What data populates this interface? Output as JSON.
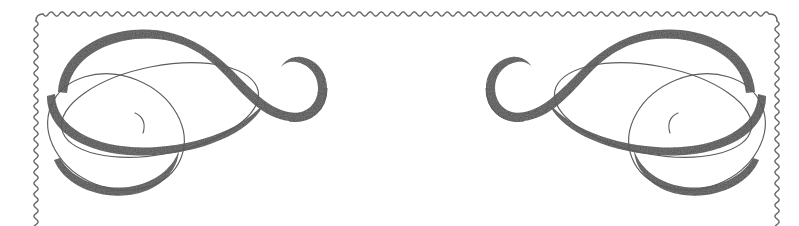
{
  "document": {
    "title": "Decorative Certificate Border Ornament",
    "description": "Scalloped rectangular border frame with mirrored calligraphic corner flourishes",
    "width": 799,
    "height": 226
  },
  "canvas": {
    "background_color": "#ffffff",
    "width": 799,
    "height": 226
  },
  "palette": {
    "ink_dark": "#4f4f4f",
    "ink_mid": "#5a5a5a",
    "ink_hairline": "#5c5c5c",
    "border_stroke": "#676767",
    "background": "#ffffff"
  },
  "border": {
    "name": "scalloped-wavy-frame",
    "style": "sine-wave",
    "stroke_color": "#676767",
    "stroke_width": 1.4,
    "wave_period": 11,
    "wave_amplitude": 2.1,
    "left_x": 36,
    "right_x": 777,
    "top_y": 14,
    "bottom_y": 226,
    "corner_radius": 7,
    "sides_visible": [
      "top",
      "left",
      "right"
    ],
    "bottom_cropped": true
  },
  "ornaments": [
    {
      "id": "left-corner-flourish",
      "name": "flourish-left",
      "position": "top-left",
      "mirrored": false,
      "description": "Calligraphic S-swash with two interlocking ellipse loops and a small upper spiral curl",
      "anchor_x": 52,
      "anchor_y": 30
    },
    {
      "id": "right-corner-flourish",
      "name": "flourish-right",
      "position": "top-right",
      "mirrored": true,
      "description": "Horizontal mirror of the left corner flourish",
      "anchor_x": 761,
      "anchor_y": 30
    }
  ],
  "flourish_geometry": {
    "swash": {
      "comment": "Main thick-to-thin calligraphic S stroke sweeping from the left loop up over the top and curling into a small spiral on the right",
      "outline": "M 58 92 C 60 58 92 34 132 30 C 176 26 208 46 232 70 C 252 90 268 108 288 112 C 306 116 318 104 318 88 C 318 74 308 64 296 62 C 290 61 284 63 281 67 C 285 60 293 56 301 57 C 316 59 327 72 327 88 C 327 110 311 124 289 121 C 264 118 246 98 226 76 C 203 51 176 35 135 39 C 98 43 70 63 67 93 Z",
      "thick_width": 19,
      "taper": "pointed at both extremities"
    },
    "lower_swash": {
      "comment": "Second heavy stroke forming the bottom of the upper ellipse loop",
      "outline": "M 56 96 C 56 132 104 150 156 146 C 212 142 254 120 266 100 C 256 126 210 150 155 154 C 98 158 48 138 48 98 Z"
    },
    "ellipse_upper": {
      "comment": "Hairline ellipse, tilted, upper of the two interlocking loops",
      "cx": 160,
      "cy": 110,
      "rx": 100,
      "ry": 44,
      "rotate": -11
    },
    "ellipse_lower": {
      "comment": "Hairline ellipse, tilted, lower of the two interlocking loops",
      "cx": 118,
      "cy": 130,
      "rx": 72,
      "ry": 55,
      "rotate": 20
    },
    "inner_curl": {
      "comment": "Small hairline hook rising from the loop intersection",
      "path": "M 140 130 C 142 122 140 116 134 114"
    }
  },
  "accessibility": {
    "alt_text": "Ornamental wavy border with two symmetrical calligraphic swirl flourishes in the upper corners"
  }
}
